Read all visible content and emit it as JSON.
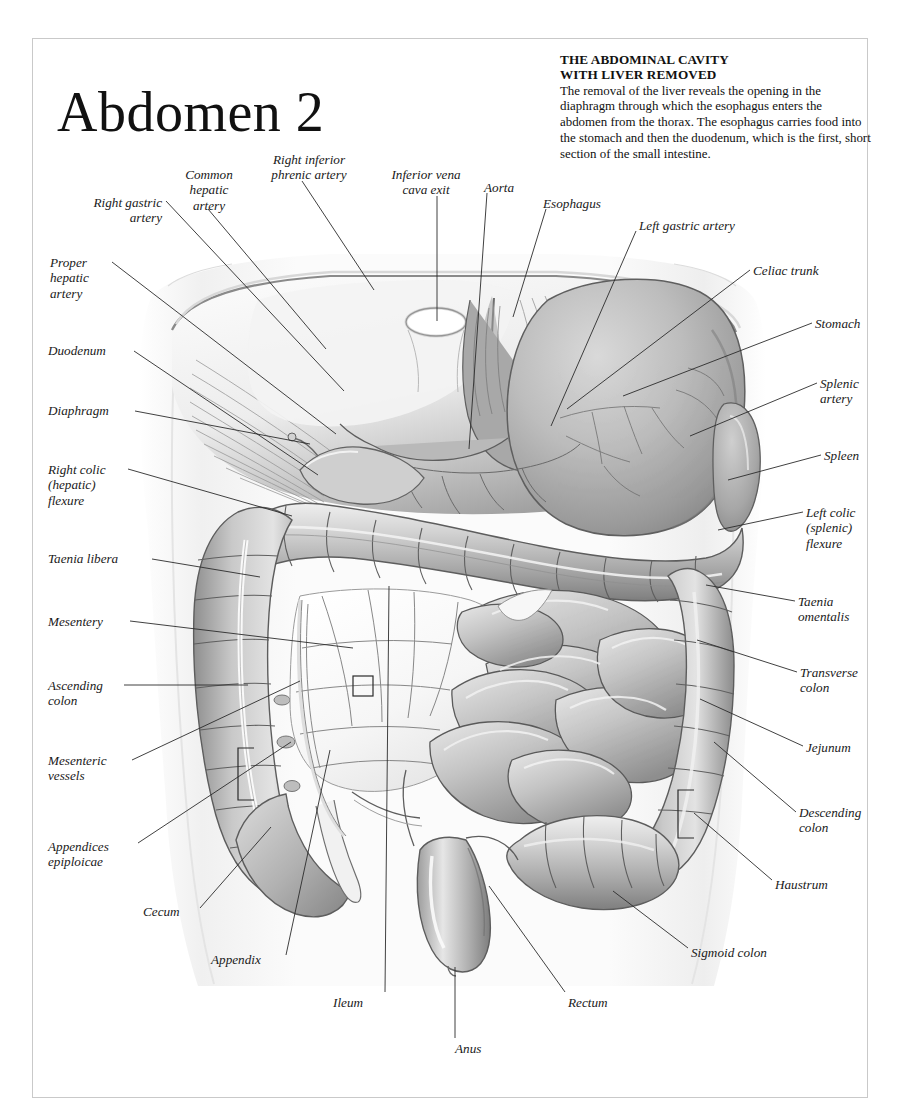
{
  "page": {
    "title": "Abdomen 2",
    "frame_color": "#c9c9c9",
    "background": "#ffffff",
    "ink": "#1a1a1a"
  },
  "description": {
    "heading_line1": "THE ABDOMINAL CAVITY",
    "heading_line2": "WITH LIVER REMOVED",
    "body": "The removal of the liver reveals the opening in the diaphragm through which the esophagus enters the abdomen from the thorax. The esophagus carries food into the stomach and then the duodenum, which is the first, short section of the small intestine."
  },
  "figure": {
    "caption": "Anterior view of the abdominal cavity with the liver removed, showing diaphragm, stomach, spleen, small intestine and large intestine.",
    "style": "grayscale anatomical engraving"
  },
  "labels": [
    {
      "id": "right-inferior-phrenic-artery",
      "text": "Right inferior\nphrenic artery",
      "align": "center",
      "x": 249,
      "y": 152,
      "w": 120,
      "leader": [
        [
          302,
          181
        ],
        [
          374,
          290
        ]
      ]
    },
    {
      "id": "common-hepatic-artery",
      "text": "Common\nhepatic\nartery",
      "align": "center",
      "x": 166,
      "y": 167,
      "w": 86,
      "leader": [
        [
          208,
          209
        ],
        [
          326,
          349
        ]
      ]
    },
    {
      "id": "inferior-vena-cava-exit",
      "text": "Inferior vena\ncava exit",
      "align": "center",
      "x": 374,
      "y": 167,
      "w": 104,
      "leader": [
        [
          437,
          196
        ],
        [
          437,
          321
        ]
      ]
    },
    {
      "id": "aorta",
      "text": "Aorta",
      "align": "left",
      "x": 484,
      "y": 180,
      "w": 52,
      "leader": [
        [
          487,
          193
        ],
        [
          469,
          449
        ]
      ]
    },
    {
      "id": "esophagus",
      "text": "Esophagus",
      "align": "left",
      "x": 543,
      "y": 196,
      "w": 80,
      "leader": [
        [
          546,
          209
        ],
        [
          513,
          317
        ]
      ]
    },
    {
      "id": "left-gastric-artery",
      "text": "Left gastric artery",
      "align": "left",
      "x": 639,
      "y": 218,
      "w": 114,
      "leader": [
        [
          636,
          231
        ],
        [
          551,
          426
        ]
      ]
    },
    {
      "id": "right-gastric-artery",
      "text": "Right gastric\nartery",
      "align": "right",
      "x": 58,
      "y": 195,
      "w": 104,
      "leader": [
        [
          166,
          201
        ],
        [
          344,
          391
        ]
      ]
    },
    {
      "id": "proper-hepatic-artery",
      "text": "Proper\nhepatic\nartery",
      "align": "left",
      "x": 50,
      "y": 255,
      "w": 78,
      "leader": [
        [
          112,
          262
        ],
        [
          336,
          434
        ]
      ]
    },
    {
      "id": "duodenum",
      "text": "Duodenum",
      "align": "left",
      "x": 48,
      "y": 343,
      "w": 82,
      "leader": [
        [
          134,
          351
        ],
        [
          318,
          475
        ]
      ]
    },
    {
      "id": "diaphragm",
      "text": "Diaphragm",
      "align": "left",
      "x": 48,
      "y": 403,
      "w": 83,
      "leader": [
        [
          135,
          411
        ],
        [
          310,
          444
        ]
      ]
    },
    {
      "id": "right-colic-hepatic-flexure",
      "text": "Right colic\n(hepatic)\nflexure",
      "align": "left",
      "x": 48,
      "y": 462,
      "w": 84,
      "leader": [
        [
          128,
          469
        ],
        [
          292,
          516
        ]
      ]
    },
    {
      "id": "taenia-libera",
      "text": "Taenia libera",
      "align": "left",
      "x": 48,
      "y": 551,
      "w": 100,
      "leader": [
        [
          152,
          559
        ],
        [
          260,
          577
        ]
      ]
    },
    {
      "id": "mesentery",
      "text": "Mesentery",
      "align": "left",
      "x": 48,
      "y": 614,
      "w": 80,
      "leader": [
        [
          130,
          621
        ],
        [
          353,
          648
        ]
      ]
    },
    {
      "id": "ascending-colon",
      "text": "Ascending\ncolon",
      "align": "left",
      "x": 48,
      "y": 678,
      "w": 80,
      "leader": [
        [
          124,
          685
        ],
        [
          248,
          685
        ]
      ]
    },
    {
      "id": "mesenteric-vessels",
      "text": "Mesenteric\nvessels",
      "align": "left",
      "x": 48,
      "y": 753,
      "w": 86,
      "leader": [
        [
          132,
          760
        ],
        [
          300,
          681
        ]
      ]
    },
    {
      "id": "appendices-epiploicae",
      "text": "Appendices\nepiploicae",
      "align": "left",
      "x": 48,
      "y": 839,
      "w": 88,
      "leader": [
        [
          138,
          843
        ],
        [
          291,
          742
        ]
      ]
    },
    {
      "id": "cecum",
      "text": "Cecum",
      "align": "left",
      "x": 143,
      "y": 904,
      "w": 56,
      "leader": [
        [
          200,
          908
        ],
        [
          271,
          827
        ]
      ]
    },
    {
      "id": "appendix",
      "text": "Appendix",
      "align": "left",
      "x": 211,
      "y": 952,
      "w": 74,
      "leader": [
        [
          286,
          955
        ],
        [
          330,
          750
        ]
      ]
    },
    {
      "id": "ileum",
      "text": "Ileum",
      "align": "left",
      "x": 333,
      "y": 995,
      "w": 48,
      "leader": [
        [
          385,
          992
        ],
        [
          389,
          586
        ]
      ]
    },
    {
      "id": "anus",
      "text": "Anus",
      "align": "left",
      "x": 455,
      "y": 1041,
      "w": 42,
      "leader": [
        [
          455,
          1038
        ],
        [
          455,
          967
        ]
      ]
    },
    {
      "id": "rectum",
      "text": "Rectum",
      "align": "left",
      "x": 568,
      "y": 995,
      "w": 58,
      "leader": [
        [
          565,
          992
        ],
        [
          489,
          886
        ]
      ]
    },
    {
      "id": "sigmoid-colon",
      "text": "Sigmoid colon",
      "align": "left",
      "x": 691,
      "y": 945,
      "w": 106,
      "leader": [
        [
          688,
          948
        ],
        [
          613,
          891
        ]
      ]
    },
    {
      "id": "haustrum",
      "text": "Haustrum",
      "align": "left",
      "x": 775,
      "y": 877,
      "w": 76,
      "leader": [
        [
          772,
          880
        ],
        [
          694,
          813
        ]
      ]
    },
    {
      "id": "descending-colon",
      "text": "Descending\ncolon",
      "align": "left",
      "x": 799,
      "y": 805,
      "w": 88,
      "leader": [
        [
          796,
          812
        ],
        [
          714,
          742
        ]
      ]
    },
    {
      "id": "jejunum",
      "text": "Jejunum",
      "align": "left",
      "x": 806,
      "y": 740,
      "w": 66,
      "leader": [
        [
          803,
          746
        ],
        [
          700,
          699
        ]
      ]
    },
    {
      "id": "transverse-colon",
      "text": "Transverse\ncolon",
      "align": "left",
      "x": 800,
      "y": 665,
      "w": 86,
      "leader": [
        [
          797,
          672
        ],
        [
          697,
          640
        ]
      ]
    },
    {
      "id": "taenia-omentalis",
      "text": "Taenia\nomentalis",
      "align": "left",
      "x": 798,
      "y": 594,
      "w": 78,
      "leader": [
        [
          795,
          601
        ],
        [
          706,
          585
        ]
      ]
    },
    {
      "id": "left-colic-splenic-flexure",
      "text": "Left colic\n(splenic)\nflexure",
      "align": "left",
      "x": 806,
      "y": 505,
      "w": 78,
      "leader": [
        [
          803,
          512
        ],
        [
          718,
          530
        ]
      ]
    },
    {
      "id": "spleen",
      "text": "Spleen",
      "align": "left",
      "x": 824,
      "y": 448,
      "w": 58,
      "leader": [
        [
          821,
          455
        ],
        [
          728,
          480
        ]
      ]
    },
    {
      "id": "splenic-artery",
      "text": "Splenic\nartery",
      "align": "left",
      "x": 820,
      "y": 376,
      "w": 66,
      "leader": [
        [
          817,
          383
        ],
        [
          690,
          436
        ]
      ]
    },
    {
      "id": "stomach",
      "text": "Stomach",
      "align": "left",
      "x": 815,
      "y": 316,
      "w": 70,
      "leader": [
        [
          812,
          323
        ],
        [
          623,
          396
        ]
      ]
    },
    {
      "id": "celiac-trunk",
      "text": "Celiac trunk",
      "align": "left",
      "x": 753,
      "y": 263,
      "w": 90,
      "leader": [
        [
          750,
          270
        ],
        [
          567,
          409
        ]
      ]
    }
  ],
  "brackets": [
    {
      "id": "haustrum-bracket",
      "x": 678,
      "y": 790,
      "w": 16,
      "h": 48
    },
    {
      "id": "taenia-libera-bracket",
      "x": 238,
      "y": 748,
      "w": 16,
      "h": 52
    },
    {
      "id": "mesentery-square",
      "x": 353,
      "y": 676,
      "w": 20,
      "h": 20
    }
  ]
}
